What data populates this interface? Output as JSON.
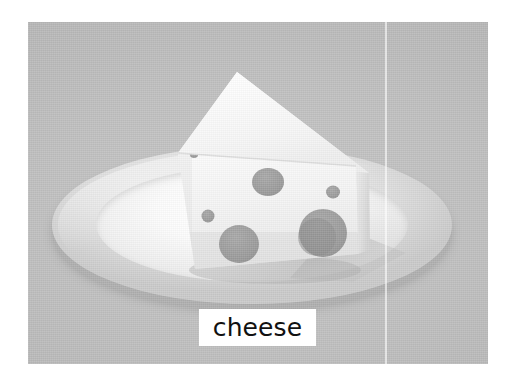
{
  "page": {
    "background_color": "#ffffff",
    "width": 514,
    "height": 380
  },
  "image": {
    "alt_name": "cheese-wedge-on-plate-photo",
    "backdrop_color": "#bdbdbd",
    "frame": {
      "left": 28,
      "top": 22,
      "width": 460,
      "height": 342
    },
    "seam_line": {
      "x": 385,
      "color": "#ffffff",
      "orientation": "vertical"
    }
  },
  "subject": {
    "name": "swiss-cheese-wedge",
    "description": "A single triangular wedge of pale swiss cheese with round holes, standing upright on a white ceramic plate",
    "cheese_color_top": "#f7f7f7",
    "cheese_color_front": "#f0f0f0",
    "cheese_color_side": "#e2e2e2",
    "hole_color": "#9a9a9a",
    "hole_count": 7,
    "holes": [
      {
        "name": "hole-tiny-upper-left",
        "cx": 24,
        "cy": 108,
        "rx": 4.2,
        "ry": 4.0
      },
      {
        "name": "hole-medium-top-center",
        "cx": 98,
        "cy": 136,
        "rx": 16,
        "ry": 14
      },
      {
        "name": "hole-small-right",
        "cx": 163,
        "cy": 146,
        "rx": 7,
        "ry": 6.5
      },
      {
        "name": "hole-small-left",
        "cx": 38,
        "cy": 170,
        "rx": 6.5,
        "ry": 6.5
      },
      {
        "name": "hole-large-lower-left",
        "cx": 69,
        "cy": 198,
        "rx": 20,
        "ry": 19
      },
      {
        "name": "hole-large-right",
        "cx": 153,
        "cy": 187,
        "rx": 24,
        "ry": 24
      },
      {
        "name": "hole-large-right-shadow",
        "cx": 147,
        "cy": 191,
        "rx": 19,
        "ry": 19
      }
    ]
  },
  "plate": {
    "name": "white-ceramic-plate",
    "rim_color": "#e2e2e2",
    "well_color": "#fdfdfd",
    "shadow_color": "#8f8f8f"
  },
  "label": {
    "text": "cheese",
    "background_color": "#ffffff",
    "text_color": "#111111",
    "box": {
      "left": 199,
      "top": 309,
      "width": 117,
      "height": 37
    }
  }
}
